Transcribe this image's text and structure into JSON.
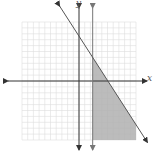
{
  "chart_data": {
    "type": "line",
    "title": "",
    "xlabel": "x",
    "ylabel": "y",
    "xlim": [
      -10,
      10
    ],
    "ylim": [
      -10,
      10
    ],
    "grid": true,
    "grid_step": 1,
    "series": [
      {
        "name": "vertical boundary",
        "kind": "vertical-line",
        "x": 2.4,
        "style": "solid",
        "arrows": "both"
      },
      {
        "name": "diagonal boundary",
        "kind": "line",
        "slope": -1.5,
        "intercept": 7.6,
        "style": "solid",
        "arrows": "both"
      }
    ],
    "shaded_region": {
      "description": "region to the right of the vertical line and below the diagonal line, clipped to grid",
      "conditions": [
        "x >= 2.4",
        "y <= -1.5x + 7.6"
      ],
      "color": "#b0b0b0"
    },
    "axis_labels": {
      "x": "x",
      "y": "y"
    }
  },
  "colors": {
    "axis": "#333333",
    "grid": "#dddddd",
    "line": "#555555",
    "shade": "#b8b8b8"
  }
}
